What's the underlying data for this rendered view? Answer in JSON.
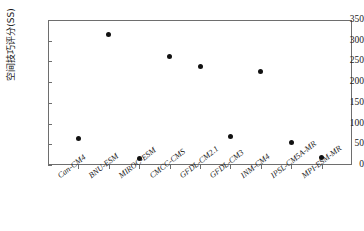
{
  "chart_data": {
    "type": "scatter",
    "title": "",
    "xlabel": "",
    "ylabel": "空间技巧评分(SS)",
    "ylim": [
      0,
      350
    ],
    "yticks": [
      0,
      50,
      100,
      150,
      200,
      250,
      300,
      350
    ],
    "ytick_labels": [
      "0",
      "50",
      "100",
      "150",
      "200",
      "250",
      "300",
      "350"
    ],
    "grid": false,
    "legend": "none",
    "marker": "filled-circle",
    "marker_color": "#111111",
    "categories": [
      "Can-CM4",
      "BNU-ESM",
      "MIROC-ESM",
      "CMCC-CMS",
      "GFDL-CM2.1",
      "GFDL-CM3",
      "INM-CM4",
      "IPSL-CM5A-MR",
      "MPI-ESM-MR"
    ],
    "values": [
      63,
      315,
      15,
      262,
      238,
      68,
      225,
      55,
      17
    ]
  },
  "axis": {
    "frame_color": "#6e6e6e"
  }
}
